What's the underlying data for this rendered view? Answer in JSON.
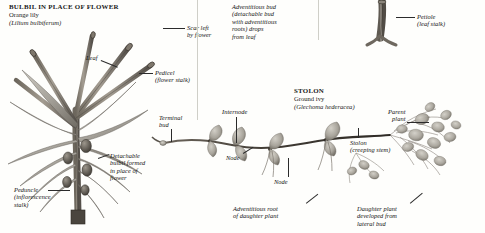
{
  "page": {
    "background": "#fefefc",
    "ink": "#1a1a1a"
  },
  "panels": [
    {
      "id": "bulbil",
      "title": "BULBIL IN PLACE OF FLOWER",
      "common_name": "Orange lily",
      "species": "(Lilium bulbiferum)"
    },
    {
      "id": "stolon",
      "title": "STOLON",
      "common_name": "Ground ivy",
      "species": "(Glechoma hederacea)"
    }
  ],
  "labels": {
    "scar_left_by_flower": "Scar left\nby flower",
    "scar_line1": "Scar left",
    "scar_line2": "by flower",
    "leaf": "Leaf",
    "pedicel_line1": "Pedicel",
    "pedicel_line2": "(flower stalk)",
    "detachable_bulbil_line1": "Detachable",
    "detachable_bulbil_line2": "bulbil formed",
    "detachable_bulbil_line3": "in place of",
    "detachable_bulbil_line4": "flower",
    "peduncle_line1": "Peduncle",
    "peduncle_line2": "(inflorescence",
    "peduncle_line3": "stalk)",
    "adventitious_bud_line1": "Adventitious bud",
    "adventitious_bud_line2": "(detachable bud",
    "adventitious_bud_line3": "with adventitious",
    "adventitious_bud_line4": "roots) drops",
    "adventitious_bud_line5": "from leaf",
    "petiole_line1": "Petiole",
    "petiole_line2": "(leaf stalk)",
    "terminal_bud_line1": "Terminal",
    "terminal_bud_line2": "bud",
    "internode": "Internode",
    "node_left": "Node",
    "node_right": "Node",
    "stolon_line1": "Stolon",
    "stolon_line2": "(creeping stem)",
    "parent_plant_line1": "Parent",
    "parent_plant_line2": "plant",
    "adventitious_root_line1": "Adventitious root",
    "adventitious_root_line2": "of daughter plant",
    "daughter_plant_line1": "Daughter plant",
    "daughter_plant_line2": "developed from",
    "daughter_plant_line3": "lateral bud"
  },
  "colors": {
    "leader_line": "#2b2b2b",
    "stem_dark": "#4a443c",
    "stem_mid": "#8d867a",
    "leaf_grey": "#b8b4ab",
    "leaf_light": "#d6d3cb",
    "foliage": "#a9a79e",
    "page_border": "#cfcfc8"
  }
}
